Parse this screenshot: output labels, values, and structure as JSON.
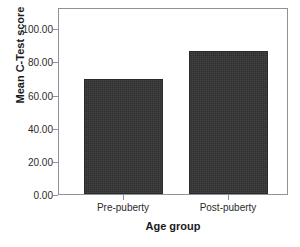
{
  "chart_data": {
    "type": "bar",
    "title": "",
    "subtitle": "",
    "xlabel": "Age group",
    "ylabel": "Mean C-Test score",
    "categories": [
      "Pre-puberty",
      "Post-puberty"
    ],
    "values": [
      68.5,
      85.2
    ],
    "ylim": [
      0,
      110
    ],
    "yticks": [
      0,
      20,
      40,
      60,
      80,
      100
    ],
    "ytick_labels": [
      "0.00",
      "20.00",
      "40.00",
      "60.00",
      "80.00",
      "100.00"
    ],
    "grid": false,
    "legend": false,
    "legend_position": "none",
    "bar_color": "#333333",
    "axis_color": "#8e9195",
    "text_color": "#2b2b2b",
    "background": "#ffffff",
    "annotations": []
  },
  "axes": {
    "y_title": "Mean C-Test score",
    "x_title": "Age group",
    "y_tick_labels": [
      "100.00",
      "80.00",
      "60.00",
      "40.00",
      "20.00",
      "0.00"
    ],
    "x_tick_labels": [
      "Pre-puberty",
      "Post-puberty"
    ]
  }
}
